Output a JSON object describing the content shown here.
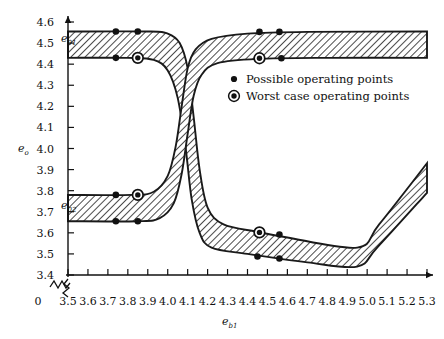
{
  "chart_data": {
    "type": "area",
    "title": "",
    "xlabel": "e_b1",
    "ylabel": "e_o",
    "xlim": [
      3.5,
      5.3
    ],
    "ylim": [
      3.4,
      4.6
    ],
    "axis_break": true,
    "grid": false,
    "x_ticks": [
      "0",
      "3.5",
      "3.6",
      "3.7",
      "3.8",
      "3.9",
      "4.0",
      "4.1",
      "4.2",
      "4.3",
      "4.4",
      "4.5",
      "4.6",
      "4.7",
      "4.8",
      "4.9",
      "5.0",
      "5.1",
      "5.2",
      "5.3"
    ],
    "y_ticks": [
      "3.4",
      "3.5",
      "3.6",
      "3.7",
      "3.8",
      "3.9",
      "4.0",
      "4.1",
      "4.2",
      "4.3",
      "4.4",
      "4.5",
      "4.6"
    ],
    "annotations": [
      {
        "text": "e_o1",
        "x": 3.5,
        "y": 4.49
      },
      {
        "text": "e_o2",
        "x": 3.5,
        "y": 3.72
      }
    ],
    "legend": {
      "position": "inside-upper-right",
      "entries": [
        {
          "marker": "filled-dot",
          "label": "Possible operating points"
        },
        {
          "marker": "ringed-dot",
          "label": "Worst case operating points"
        }
      ]
    },
    "series": [
      {
        "name": "upper-band",
        "fill": "hatch-45",
        "upper": [
          [
            3.5,
            4.555
          ],
          [
            3.9,
            4.555
          ],
          [
            4.0,
            4.545
          ],
          [
            4.06,
            4.5
          ],
          [
            4.1,
            4.38
          ],
          [
            4.13,
            4.15
          ],
          [
            4.16,
            3.9
          ],
          [
            4.2,
            3.72
          ],
          [
            4.28,
            3.64
          ],
          [
            4.45,
            3.605
          ],
          [
            4.6,
            3.578
          ],
          [
            4.95,
            3.53
          ],
          [
            5.06,
            3.64
          ],
          [
            5.3,
            3.93
          ]
        ],
        "lower": [
          [
            3.5,
            4.43
          ],
          [
            3.8,
            4.43
          ],
          [
            3.93,
            4.42
          ],
          [
            4.0,
            4.37
          ],
          [
            4.05,
            4.24
          ],
          [
            4.09,
            4.0
          ],
          [
            4.12,
            3.76
          ],
          [
            4.16,
            3.6
          ],
          [
            4.22,
            3.53
          ],
          [
            4.4,
            3.5
          ],
          [
            4.7,
            3.46
          ],
          [
            4.95,
            3.44
          ],
          [
            5.05,
            3.53
          ],
          [
            5.3,
            3.79
          ]
        ]
      },
      {
        "name": "lower-band",
        "fill": "hatch-45",
        "upper": [
          [
            3.5,
            3.78
          ],
          [
            3.82,
            3.78
          ],
          [
            3.93,
            3.795
          ],
          [
            4.0,
            3.87
          ],
          [
            4.04,
            4.01
          ],
          [
            4.07,
            4.2
          ],
          [
            4.1,
            4.38
          ],
          [
            4.14,
            4.47
          ],
          [
            4.22,
            4.52
          ],
          [
            4.4,
            4.545
          ],
          [
            4.7,
            4.553
          ],
          [
            5.3,
            4.555
          ]
        ],
        "lower": [
          [
            3.5,
            3.655
          ],
          [
            3.85,
            3.655
          ],
          [
            3.96,
            3.67
          ],
          [
            4.03,
            3.74
          ],
          [
            4.07,
            3.88
          ],
          [
            4.1,
            4.07
          ],
          [
            4.13,
            4.25
          ],
          [
            4.17,
            4.35
          ],
          [
            4.25,
            4.405
          ],
          [
            4.45,
            4.425
          ],
          [
            4.8,
            4.43
          ],
          [
            5.3,
            4.43
          ]
        ]
      }
    ],
    "points": [
      {
        "x": 3.74,
        "y": 4.555,
        "type": "possible"
      },
      {
        "x": 3.85,
        "y": 4.555,
        "type": "possible"
      },
      {
        "x": 3.74,
        "y": 4.43,
        "type": "possible"
      },
      {
        "x": 3.85,
        "y": 4.43,
        "type": "worst"
      },
      {
        "x": 4.46,
        "y": 4.553,
        "type": "possible"
      },
      {
        "x": 4.56,
        "y": 4.553,
        "type": "possible"
      },
      {
        "x": 4.46,
        "y": 4.428,
        "type": "worst"
      },
      {
        "x": 4.57,
        "y": 4.428,
        "type": "possible"
      },
      {
        "x": 3.74,
        "y": 3.78,
        "type": "possible"
      },
      {
        "x": 3.85,
        "y": 3.78,
        "type": "worst"
      },
      {
        "x": 3.74,
        "y": 3.655,
        "type": "possible"
      },
      {
        "x": 3.85,
        "y": 3.655,
        "type": "possible"
      },
      {
        "x": 4.46,
        "y": 3.602,
        "type": "worst"
      },
      {
        "x": 4.56,
        "y": 3.592,
        "type": "possible"
      },
      {
        "x": 4.45,
        "y": 3.488,
        "type": "possible"
      },
      {
        "x": 4.56,
        "y": 3.478,
        "type": "possible"
      }
    ]
  }
}
